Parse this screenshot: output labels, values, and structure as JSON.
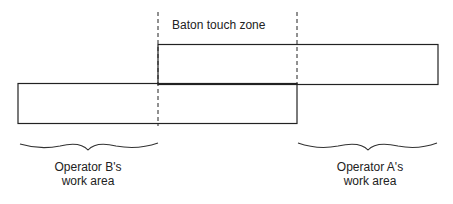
{
  "diagram": {
    "zone_label": "Baton touch zone",
    "operator_b": {
      "line1": "Operator B's",
      "line2": "work area"
    },
    "operator_a": {
      "line1": "Operator A's",
      "line2": "work area"
    },
    "colors": {
      "stroke": "#222222",
      "background": "#ffffff"
    }
  }
}
